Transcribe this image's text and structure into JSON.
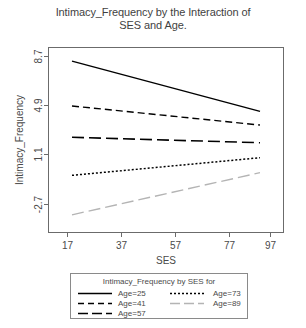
{
  "chart_data": {
    "type": "line",
    "title": "Intimacy_Frequency by the Interaction of SES and Age.",
    "title_line1": "Intimacy_Frequency by the Interaction of",
    "title_line2": "SES and Age.",
    "xlabel": "SES",
    "ylabel": "Intimacy_Frequency",
    "x": [
      17,
      97
    ],
    "xticks": [
      17,
      37,
      57,
      77,
      97
    ],
    "xticklabels": [
      "17",
      "37",
      "57",
      "77",
      "97"
    ],
    "yticks": [
      8.7,
      4.9,
      1.1,
      -2.7
    ],
    "yticklabels": [
      "8.7",
      "4.9",
      "1.1",
      "-2.7"
    ],
    "xlim": [
      7,
      107
    ],
    "ylim": [
      -4.0,
      9.6
    ],
    "grid": false,
    "legend_position": "below-plot",
    "legend_title": "Intimacy_Frequency by SES for",
    "series": [
      {
        "name": "Age=25",
        "label": "Age=25",
        "values": [
          8.6,
          4.9
        ],
        "style": "solid",
        "color": "#000000"
      },
      {
        "name": "Age=41",
        "label": "Age=41",
        "values": [
          5.3,
          3.9
        ],
        "style": "dashed",
        "color": "#000000"
      },
      {
        "name": "Age=57",
        "label": "Age=57",
        "values": [
          3.0,
          2.6
        ],
        "style": "long-dash",
        "color": "#000000"
      },
      {
        "name": "Age=73",
        "label": "Age=73",
        "values": [
          0.2,
          1.5
        ],
        "style": "dotted",
        "color": "#000000"
      },
      {
        "name": "Age=89",
        "label": "Age=89",
        "values": [
          -2.7,
          0.4
        ],
        "style": "light-long-dash",
        "color": "#b4b4b4"
      }
    ]
  },
  "legend": {
    "title": "Intimacy_Frequency by SES for",
    "column_left": [
      "Age=25",
      "Age=41",
      "Age=57"
    ],
    "column_right": [
      "Age=73",
      "Age=89"
    ]
  },
  "colors": {
    "background": "#ffffff",
    "axis": "#6b6b6b",
    "text": "#4a4a4a",
    "line_dark": "#000000",
    "line_light": "#b4b4b4"
  }
}
